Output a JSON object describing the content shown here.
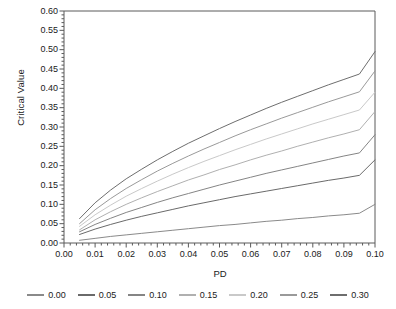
{
  "chart_data": {
    "type": "line",
    "title": "",
    "xlabel": "PD",
    "ylabel": "Critical Value",
    "xlim": [
      0.0,
      0.1
    ],
    "ylim": [
      0.0,
      0.6
    ],
    "xticks": [
      "0.00",
      "0.01",
      "0.02",
      "0.03",
      "0.04",
      "0.05",
      "0.06",
      "0.07",
      "0.08",
      "0.09",
      "0.10"
    ],
    "xtick_values": [
      0.0,
      0.01,
      0.02,
      0.03,
      0.04,
      0.05,
      0.06,
      0.07,
      0.08,
      0.09,
      0.1
    ],
    "yticks": [
      "0.00",
      "0.05",
      "0.10",
      "0.15",
      "0.20",
      "0.25",
      "0.30",
      "0.35",
      "0.40",
      "0.45",
      "0.50",
      "0.55",
      "0.60"
    ],
    "ytick_values": [
      0.0,
      0.05,
      0.1,
      0.15,
      0.2,
      0.25,
      0.3,
      0.35,
      0.4,
      0.45,
      0.5,
      0.55,
      0.6
    ],
    "grid": false,
    "legend_position": "bottom",
    "legend_title": "",
    "minor_ticks": true,
    "x": [
      0.005,
      0.01,
      0.015,
      0.02,
      0.025,
      0.03,
      0.035,
      0.04,
      0.045,
      0.05,
      0.055,
      0.06,
      0.065,
      0.07,
      0.075,
      0.08,
      0.085,
      0.09,
      0.095,
      0.1
    ],
    "series": [
      {
        "name": "0.30",
        "color": "#6e6e6e",
        "values": [
          0.063,
          0.104,
          0.137,
          0.166,
          0.191,
          0.215,
          0.237,
          0.258,
          0.277,
          0.296,
          0.314,
          0.331,
          0.348,
          0.364,
          0.379,
          0.394,
          0.409,
          0.423,
          0.437,
          0.495
        ]
      },
      {
        "name": "0.25",
        "color": "#9a9a9a",
        "values": [
          0.05,
          0.086,
          0.115,
          0.141,
          0.164,
          0.186,
          0.206,
          0.225,
          0.243,
          0.26,
          0.277,
          0.293,
          0.308,
          0.323,
          0.337,
          0.351,
          0.365,
          0.378,
          0.391,
          0.445
        ]
      },
      {
        "name": "0.20",
        "color": "#c9c9c9",
        "values": [
          0.043,
          0.073,
          0.098,
          0.121,
          0.141,
          0.16,
          0.178,
          0.195,
          0.211,
          0.226,
          0.241,
          0.255,
          0.269,
          0.282,
          0.295,
          0.308,
          0.32,
          0.332,
          0.344,
          0.39
        ]
      },
      {
        "name": "0.15",
        "color": "#b0b0b0",
        "values": [
          0.034,
          0.06,
          0.081,
          0.1,
          0.117,
          0.133,
          0.148,
          0.163,
          0.176,
          0.19,
          0.202,
          0.215,
          0.227,
          0.238,
          0.25,
          0.261,
          0.272,
          0.282,
          0.293,
          0.34
        ]
      },
      {
        "name": "0.10",
        "color": "#858585",
        "values": [
          0.029,
          0.048,
          0.064,
          0.079,
          0.092,
          0.105,
          0.117,
          0.128,
          0.139,
          0.15,
          0.16,
          0.17,
          0.18,
          0.189,
          0.198,
          0.207,
          0.216,
          0.225,
          0.233,
          0.28
        ]
      },
      {
        "name": "0.05",
        "color": "#6a6a6a",
        "values": [
          0.022,
          0.036,
          0.048,
          0.059,
          0.069,
          0.078,
          0.087,
          0.096,
          0.104,
          0.112,
          0.12,
          0.127,
          0.134,
          0.141,
          0.148,
          0.155,
          0.162,
          0.168,
          0.175,
          0.215
        ]
      },
      {
        "name": "0.00",
        "color": "#8a8a8a",
        "values": [
          0.007,
          0.012,
          0.017,
          0.021,
          0.025,
          0.029,
          0.033,
          0.037,
          0.041,
          0.045,
          0.048,
          0.052,
          0.056,
          0.059,
          0.063,
          0.066,
          0.07,
          0.073,
          0.077,
          0.1
        ]
      }
    ]
  },
  "axes": {
    "x_title": "PD",
    "y_title": "Critical Value",
    "frame_color": "#5a5a5a",
    "tick_color": "#5a5a5a"
  },
  "legend": {
    "items": [
      {
        "label": "0.00",
        "color": "#8a8a8a"
      },
      {
        "label": "0.05",
        "color": "#6a6a6a"
      },
      {
        "label": "0.10",
        "color": "#858585"
      },
      {
        "label": "0.15",
        "color": "#b0b0b0"
      },
      {
        "label": "0.20",
        "color": "#c9c9c9"
      },
      {
        "label": "0.25",
        "color": "#9a9a9a"
      },
      {
        "label": "0.30",
        "color": "#6e6e6e"
      }
    ]
  }
}
